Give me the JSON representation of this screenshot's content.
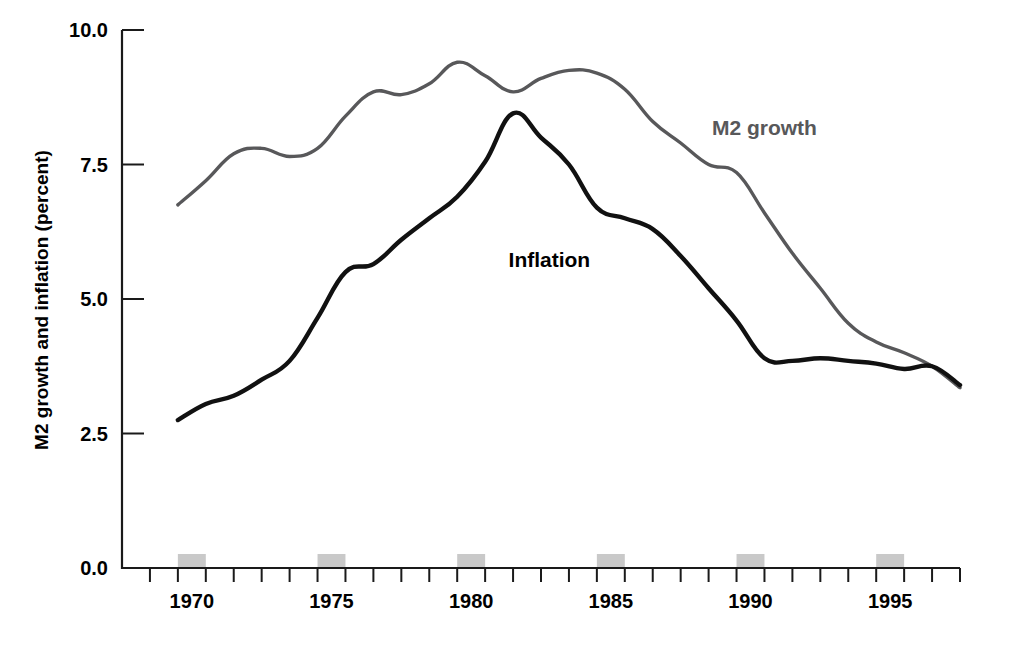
{
  "chart_data": {
    "type": "line",
    "title": "",
    "subtitle": "",
    "xlabel": "",
    "ylabel": "M2 growth and inflation (percent)",
    "ylim": [
      0.0,
      10.0
    ],
    "xlim": [
      1968,
      1998
    ],
    "grid": false,
    "legend_position": "inline-annotation",
    "y_ticks": [
      "0.0",
      "2.5",
      "5.0",
      "7.5",
      "10.0"
    ],
    "y_tick_values": [
      0.0,
      2.5,
      5.0,
      7.5,
      10.0
    ],
    "x_ticks": [
      "1970",
      "1975",
      "1980",
      "1985",
      "1990",
      "1995"
    ],
    "x_tick_values": [
      1970,
      1975,
      1980,
      1985,
      1990,
      1995
    ],
    "x_minor_tick_values": [
      1968,
      1969,
      1970,
      1971,
      1972,
      1973,
      1974,
      1975,
      1976,
      1977,
      1978,
      1979,
      1980,
      1981,
      1982,
      1983,
      1984,
      1985,
      1986,
      1987,
      1988,
      1989,
      1990,
      1991,
      1992,
      1993,
      1994,
      1995,
      1996,
      1997,
      1998
    ],
    "shaded_band_years": [
      1970,
      1975,
      1980,
      1985,
      1990,
      1995
    ],
    "shaded_band_color": "#c9c9c9",
    "x": [
      1970,
      1971,
      1972,
      1973,
      1974,
      1975,
      1976,
      1977,
      1978,
      1979,
      1980,
      1981,
      1982,
      1983,
      1984,
      1985,
      1986,
      1987,
      1988,
      1989,
      1990,
      1991,
      1992,
      1993,
      1994,
      1995,
      1996,
      1997,
      1998
    ],
    "series": [
      {
        "name": "M2 growth",
        "color": "#58585a",
        "label_x": 1991.0,
        "label_y": 8.05,
        "values": [
          6.75,
          7.2,
          7.7,
          7.8,
          7.65,
          7.8,
          8.4,
          8.85,
          8.8,
          9.0,
          9.4,
          9.15,
          8.85,
          9.1,
          9.25,
          9.2,
          8.9,
          8.3,
          7.9,
          7.5,
          7.35,
          6.6,
          5.85,
          5.2,
          4.55,
          4.2,
          4.0,
          3.75,
          3.35
        ]
      },
      {
        "name": "Inflation",
        "color": "#111111",
        "label_x": 1983.3,
        "label_y": 5.6,
        "values": [
          2.75,
          3.05,
          3.2,
          3.5,
          3.85,
          4.65,
          5.5,
          5.65,
          6.1,
          6.5,
          6.9,
          7.55,
          8.45,
          8.0,
          7.5,
          6.7,
          6.5,
          6.3,
          5.8,
          5.2,
          4.6,
          3.9,
          3.85,
          3.9,
          3.85,
          3.8,
          3.7,
          3.75,
          3.4
        ]
      }
    ]
  }
}
